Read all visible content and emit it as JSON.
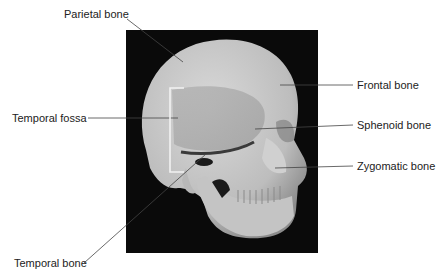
{
  "figure": {
    "background": "#ffffff",
    "photo_background": "#0a0a0a",
    "bone_color": "#c8c8c8",
    "leader_color": "#444444"
  },
  "labels": {
    "parietal": "Parietal bone",
    "frontal": "Frontal bone",
    "temporal_fossa": "Temporal fossa",
    "sphenoid": "Sphenoid bone",
    "zygomatic": "Zygomatic bone",
    "temporal": "Temporal bone"
  }
}
